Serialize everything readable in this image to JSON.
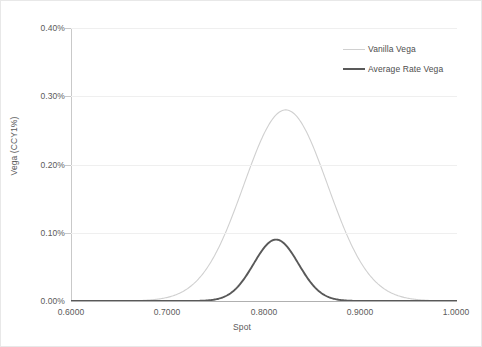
{
  "chart_data": {
    "type": "line",
    "title": "",
    "xlabel": "Spot",
    "ylabel": "Vega (CCY1%)",
    "xlim": [
      0.6,
      1.0
    ],
    "ylim": [
      0.0,
      0.004
    ],
    "grid": true,
    "legend_position": "top-right",
    "x_tick_labels": [
      "0.6000",
      "0.7000",
      "0.8000",
      "0.9000",
      "1.0000"
    ],
    "x_ticks": [
      0.6,
      0.7,
      0.8,
      0.9,
      1.0
    ],
    "y_tick_labels": [
      "0.00%",
      "0.10%",
      "0.20%",
      "0.30%",
      "0.40%"
    ],
    "y_ticks": [
      0.0,
      0.001,
      0.002,
      0.003,
      0.004
    ],
    "series": [
      {
        "name": "Vanilla Vega",
        "color": "#d0d0d0",
        "width": 1.1,
        "peak_x": 0.8225,
        "peak_y": 0.0028,
        "sigma": 0.0435,
        "values": [
          0.0,
          0.0,
          0.0,
          0.0,
          0.0,
          1e-07,
          4e-07,
          1.8e-06,
          6.4e-06,
          2e-05,
          5.52e-05,
          0.0001342,
          0.000288,
          0.0005452,
          0.0009107,
          0.0013424,
          0.0017453,
          0.0020029,
          0.0022804,
          0.00256,
          0.002743,
          0.0027987,
          0.002743,
          0.00256,
          0.0022804,
          0.001934,
          0.001556,
          0.00118,
          0.00084,
          0.00056,
          0.000349,
          0.000203,
          0.00011,
          5.56e-05,
          2.61e-05,
          1.14e-05,
          4.6e-06,
          1.7e-06,
          6e-07,
          2e-07,
          0.0
        ],
        "x": [
          0.6,
          0.61,
          0.62,
          0.63,
          0.64,
          0.65,
          0.66,
          0.67,
          0.68,
          0.69,
          0.7,
          0.71,
          0.72,
          0.73,
          0.74,
          0.75,
          0.76,
          0.77,
          0.78,
          0.79,
          0.8,
          0.81,
          0.82,
          0.83,
          0.84,
          0.85,
          0.86,
          0.87,
          0.88,
          0.89,
          0.9,
          0.91,
          0.92,
          0.93,
          0.94,
          0.95,
          0.96,
          0.97,
          0.98,
          0.99,
          1.0
        ]
      },
      {
        "name": "Average Rate Vega",
        "color": "#595959",
        "width": 1.9,
        "peak_x": 0.8125,
        "peak_y": 0.0009,
        "sigma": 0.0232,
        "values": [
          0.0,
          0.0,
          0.0,
          0.0,
          0.0,
          0.0,
          0.0,
          0.0,
          0.0,
          0.0,
          0.0,
          1e-07,
          4e-07,
          1.9e-06,
          7.8e-06,
          2.75e-05,
          8.32e-05,
          0.000216,
          0.000442,
          0.000724,
          0.000881,
          0.0009,
          0.00079,
          0.000556,
          0.00031,
          0.000139,
          5e-05,
          1.46e-05,
          3.5e-06,
          7e-07,
          1e-07,
          0.0,
          0.0,
          0.0,
          0.0,
          0.0,
          0.0,
          0.0,
          0.0,
          0.0,
          0.0
        ],
        "x": [
          0.6,
          0.61,
          0.62,
          0.63,
          0.64,
          0.65,
          0.66,
          0.67,
          0.68,
          0.69,
          0.7,
          0.71,
          0.72,
          0.73,
          0.74,
          0.75,
          0.76,
          0.77,
          0.78,
          0.79,
          0.8,
          0.81,
          0.82,
          0.83,
          0.84,
          0.85,
          0.86,
          0.87,
          0.88,
          0.89,
          0.9,
          0.91,
          0.92,
          0.93,
          0.94,
          0.95,
          0.96,
          0.97,
          0.98,
          0.99,
          1.0
        ]
      }
    ]
  },
  "axes": {
    "x_title": "Spot",
    "y_title": "Vega (CCY1%)",
    "y_labels": [
      "0.40%",
      "0.30%",
      "0.20%",
      "0.10%",
      "0.00%"
    ],
    "x_labels": [
      "0.6000",
      "0.7000",
      "0.8000",
      "0.9000",
      "1.0000"
    ]
  },
  "legend": {
    "items": [
      {
        "label": "Vanilla Vega",
        "color": "#d0d0d0",
        "thickness": "1px"
      },
      {
        "label": "Average Rate Vega",
        "color": "#595959",
        "thickness": "2px"
      }
    ]
  },
  "caption": {
    "fragment": ""
  }
}
